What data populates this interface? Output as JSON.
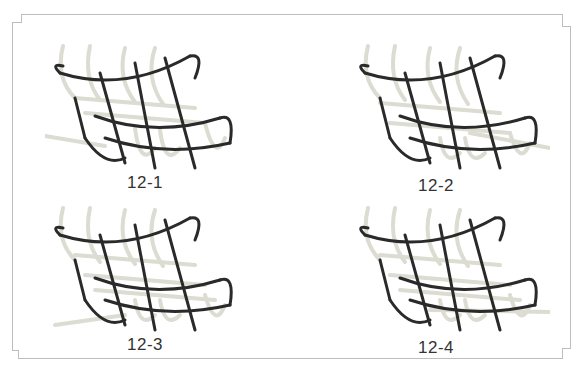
{
  "figures": [
    {
      "id": "12-1",
      "caption": "12-1"
    },
    {
      "id": "12-2",
      "caption": "12-2"
    },
    {
      "id": "12-3",
      "caption": "12-3"
    },
    {
      "id": "12-4",
      "caption": "12-4"
    }
  ],
  "colors": {
    "frame": "#bdbdbd",
    "dark_cord": "#2a2a2a",
    "light_cord": "#e4e4dc",
    "caption": "#333333"
  }
}
